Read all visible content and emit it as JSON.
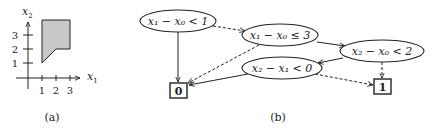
{
  "figure_a": {
    "caption": "(a)",
    "x_axis_label": "x",
    "x_axis_sub": "1",
    "y_axis_label": "x",
    "y_axis_sub": "2",
    "x_ticks": [
      "1",
      "2",
      "3"
    ],
    "y_ticks": [
      "1",
      "2",
      "3"
    ],
    "region_fill": "#c8c8c8",
    "region_vertices": [
      [
        1,
        1
      ],
      [
        1,
        3.9
      ],
      [
        3,
        3.9
      ],
      [
        3,
        2
      ],
      [
        2,
        2
      ]
    ]
  },
  "figure_b": {
    "caption": "(b)",
    "nodes": [
      {
        "id": "n1",
        "type": "ellipse",
        "label": "x₁ − x₀ < 1"
      },
      {
        "id": "n2",
        "type": "ellipse",
        "label": "x₁ − x₀ ≤ 3"
      },
      {
        "id": "n3",
        "type": "ellipse",
        "label": "x₂ − x₀ < 2"
      },
      {
        "id": "n4",
        "type": "ellipse",
        "label": "x₂ − x₁ < 0"
      },
      {
        "id": "t0",
        "type": "terminal",
        "label": "0"
      },
      {
        "id": "t1",
        "type": "terminal",
        "label": "1"
      }
    ],
    "edges": [
      {
        "from": "n1",
        "to": "t0",
        "style": "solid"
      },
      {
        "from": "n1",
        "to": "n2",
        "style": "dashed"
      },
      {
        "from": "n2",
        "to": "n3",
        "style": "solid"
      },
      {
        "from": "n2",
        "to": "t0",
        "style": "dashed"
      },
      {
        "from": "n3",
        "to": "n4",
        "style": "solid"
      },
      {
        "from": "n3",
        "to": "t1",
        "style": "dashed"
      },
      {
        "from": "n4",
        "to": "t0",
        "style": "solid"
      },
      {
        "from": "n4",
        "to": "t1",
        "style": "dashed"
      }
    ]
  }
}
